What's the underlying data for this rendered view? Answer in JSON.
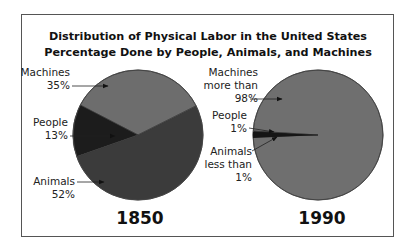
{
  "chart_data": [
    {
      "type": "pie",
      "title": "Distribution of Physical Labor in the United States",
      "subtitle": "Percentage Done by People, Animals, and Machines",
      "caption": "1850",
      "slices": [
        {
          "name": "Machines",
          "value": 35,
          "label_lines": [
            "Machines",
            "35%"
          ],
          "color": "#6d6d6d"
        },
        {
          "name": "People",
          "value": 13,
          "label_lines": [
            "People",
            "13%"
          ],
          "color": "#1c1c1c"
        },
        {
          "name": "Animals",
          "value": 52,
          "label_lines": [
            "Animals",
            "52%"
          ],
          "color": "#3b3b3b"
        }
      ]
    },
    {
      "type": "pie",
      "title": "Distribution of Physical Labor in the United States",
      "subtitle": "Percentage Done by People, Animals, and Machines",
      "caption": "1990",
      "slices": [
        {
          "name": "Machines",
          "value": 98.6,
          "label_lines": [
            "Machines",
            "more than",
            "98%"
          ],
          "color": "#6f6f6f"
        },
        {
          "name": "People",
          "value": 1,
          "label_lines": [
            "People",
            "1%"
          ],
          "color": "#1c1c1c"
        },
        {
          "name": "Animals",
          "value": 0.4,
          "label_lines": [
            "Animals",
            "less than",
            "1%"
          ],
          "color": "#2a2a2a"
        }
      ]
    }
  ],
  "title_line1": "Distribution of Physical Labor in the United States",
  "title_line2": "Percentage Done by People, Animals, and Machines",
  "year_left": "1850",
  "year_right": "1990"
}
